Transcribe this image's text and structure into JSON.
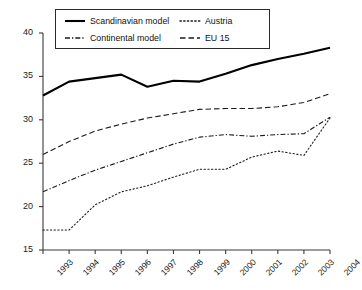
{
  "chart_data": {
    "type": "line",
    "title": "",
    "xlabel": "",
    "ylabel": "",
    "categories": [
      "1993",
      "1994",
      "1995",
      "1996",
      "1997",
      "1998",
      "1999",
      "2000",
      "2001",
      "2002",
      "2003",
      "2004"
    ],
    "x": [
      1993,
      1994,
      1995,
      1996,
      1997,
      1998,
      1999,
      2000,
      2001,
      2002,
      2003,
      2004
    ],
    "ylim": [
      15,
      40
    ],
    "yticks": [
      15,
      20,
      25,
      30,
      35,
      40
    ],
    "xlim": [
      1993,
      2004
    ],
    "grid": false,
    "legend_position": "top-center-inside",
    "series": [
      {
        "name": "Scandinavian model",
        "style": "solid",
        "color": "#000000",
        "width": 2.1,
        "values": [
          32.8,
          34.4,
          34.8,
          35.2,
          33.8,
          34.5,
          34.4,
          35.3,
          36.3,
          37.0,
          37.6,
          38.3
        ]
      },
      {
        "name": "EU 15",
        "style": "dashed",
        "color": "#1a1a1a",
        "width": 1.1,
        "values": [
          26.0,
          27.5,
          28.7,
          29.5,
          30.2,
          30.7,
          31.2,
          31.3,
          31.3,
          31.5,
          32.0,
          33.0
        ]
      },
      {
        "name": "Continental model",
        "style": "dashdot",
        "color": "#1a1a1a",
        "width": 1.1,
        "values": [
          21.7,
          23.0,
          24.2,
          25.2,
          26.2,
          27.2,
          28.0,
          28.3,
          28.1,
          28.3,
          28.4,
          30.3
        ]
      },
      {
        "name": "Austria",
        "style": "dotted",
        "color": "#1a1a1a",
        "width": 1.1,
        "values": [
          17.3,
          17.3,
          20.2,
          21.7,
          22.4,
          23.4,
          24.3,
          24.3,
          25.7,
          26.4,
          25.9,
          30.2
        ]
      }
    ],
    "legend": [
      {
        "label": "Scandinavian model",
        "style": "solid"
      },
      {
        "label": "Austria",
        "style": "dotted"
      },
      {
        "label": "Continental model",
        "style": "dashdot"
      },
      {
        "label": "EU 15",
        "style": "dashed"
      }
    ]
  }
}
